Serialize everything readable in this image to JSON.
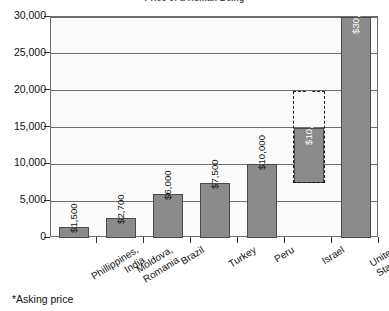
{
  "chart_data": {
    "type": "bar",
    "title": "Price of a Human Being",
    "categories": [
      "Phillippines, India",
      "Moldova, Romania",
      "Brazil",
      "Turkey",
      "Peru",
      "Israel",
      "United States"
    ],
    "category_lines": [
      [
        "Phillippines,",
        "India"
      ],
      [
        "Moldova,",
        "Romania"
      ],
      [
        "Brazil"
      ],
      [
        "Turkey"
      ],
      [
        "Peru"
      ],
      [
        "Israel"
      ],
      [
        "United",
        "States"
      ]
    ],
    "values": [
      1500,
      2700,
      6000,
      7500,
      10000,
      15000,
      30000
    ],
    "value_labels": [
      "$1,500",
      "$2,700",
      "$6,000",
      "$7,500",
      "$10,000",
      "$10,000-$20,000",
      "$30,000*"
    ],
    "label_placement": [
      "above",
      "above",
      "above",
      "above",
      "above",
      "inside",
      "inside"
    ],
    "ranges": [
      null,
      null,
      null,
      null,
      null,
      {
        "low": 7500,
        "high": 20000,
        "bar_low": 7500,
        "bar_high": 15000,
        "style": "dashed"
      },
      null
    ],
    "xlabel": "",
    "ylabel": "",
    "ylim": [
      0,
      30000
    ],
    "ytick_values": [
      0,
      5000,
      10000,
      15000,
      20000,
      25000,
      30000
    ],
    "ytick_labels": [
      "0",
      "5,000",
      "10,000",
      "15,000",
      "20,000",
      "25,000",
      "30,000"
    ],
    "grid": true,
    "legend": false,
    "bar_color": "#8b8b8b",
    "bar_border_color": "#4a4a4a",
    "axis_color": "#6d6d6d",
    "plot_bg": "#fbfbfb"
  },
  "footnote": {
    "text": "*Asking price"
  }
}
